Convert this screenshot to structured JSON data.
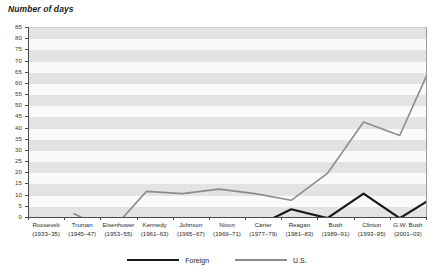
{
  "chart_data": {
    "type": "line",
    "title": "Number of days",
    "xlabel": "",
    "ylabel": "Number of days",
    "ylim": [
      0,
      85
    ],
    "ytick_step": 5,
    "grid": "horizontal-bands",
    "legend_position": "bottom-center",
    "categories": [
      "Roosevelt (1933–35)",
      "Truman (1945–47)",
      "Eisenhower (1953–55)",
      "Kennedy (1961–63)",
      "Johnson (1965–67)",
      "Nixon (1969–71)",
      "Carter (1977–79)",
      "Reagan (1981–83)",
      "Bush (1989–91)",
      "Clinton (1993–95)",
      "G.W. Bush (2001–03)"
    ],
    "series": [
      {
        "name": "Foreign",
        "color": "#1a1a1a",
        "values": [
          1,
          3,
          4,
          6,
          4,
          8,
          16,
          12,
          23,
          12,
          22
        ]
      },
      {
        "name": "U.S.",
        "color": "#8c8c8c",
        "values": [
          14,
          6,
          24,
          23,
          25,
          23,
          20,
          32,
          55,
          49,
          85
        ]
      }
    ]
  },
  "axes": {
    "y_ticks": [
      "0",
      "5",
      "10",
      "15",
      "20",
      "25",
      "30",
      "35",
      "40",
      "45",
      "50",
      "55",
      "60",
      "65",
      "70",
      "75",
      "80",
      "85"
    ],
    "x_ticks": [
      {
        "name": "Roosevelt",
        "years": "(1933–35)"
      },
      {
        "name": "Truman",
        "years": "(1945–47)"
      },
      {
        "name": "Eisenhower",
        "years": "(1953–55)"
      },
      {
        "name": "Kennedy",
        "years": "(1961–63)"
      },
      {
        "name": "Johnson",
        "years": "(1965–67)"
      },
      {
        "name": "Nixon",
        "years": "(1969–71)"
      },
      {
        "name": "Carter",
        "years": "(1977–79)"
      },
      {
        "name": "Reagan",
        "years": "(1981–83)"
      },
      {
        "name": "Bush",
        "years": "(1989–91)"
      },
      {
        "name": "Clinton",
        "years": "(1993–95)"
      },
      {
        "name": "G.W. Bush",
        "years": "(2001–03)"
      }
    ]
  },
  "legend": [
    {
      "label": "Foreign",
      "color": "#1a1a1a"
    },
    {
      "label": "U.S.",
      "color": "#8c8c8c"
    }
  ]
}
